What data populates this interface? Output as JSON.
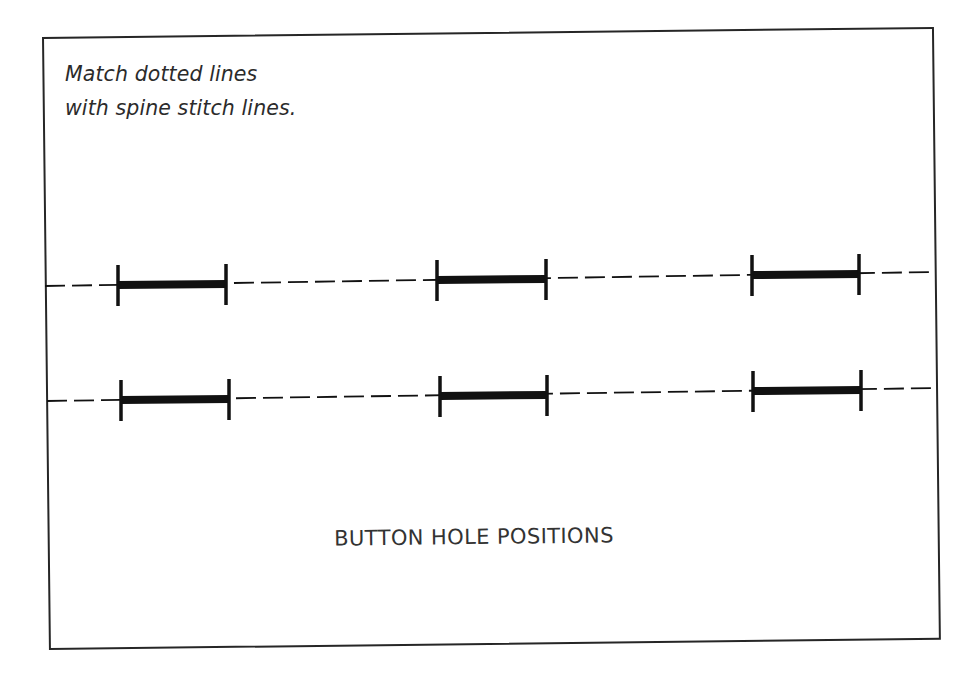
{
  "diagram": {
    "instruction_lines": [
      "Match dotted lines",
      "with spine stitch lines."
    ],
    "caption": "BUTTON HOLE POSITIONS",
    "colors": {
      "ink": "#111111",
      "border": "#262626",
      "text": "#2b2b2b",
      "background": "#ffffff"
    },
    "rows": [
      {
        "label": "row-1",
        "dashed_line": {
          "x1": 45,
          "y1": 286,
          "x2": 934,
          "y2": 272
        },
        "button_holes": [
          {
            "x1": 118,
            "x2": 226,
            "y1": 285,
            "y2": 284
          },
          {
            "x1": 437,
            "x2": 546,
            "y1": 280,
            "y2": 279
          },
          {
            "x1": 752,
            "x2": 859,
            "y1": 275,
            "y2": 274
          }
        ]
      },
      {
        "label": "row-2",
        "dashed_line": {
          "x1": 47,
          "y1": 401,
          "x2": 937,
          "y2": 388
        },
        "button_holes": [
          {
            "x1": 121,
            "x2": 229,
            "y1": 400,
            "y2": 399
          },
          {
            "x1": 440,
            "x2": 547,
            "y1": 396,
            "y2": 395
          },
          {
            "x1": 753,
            "x2": 861,
            "y1": 391,
            "y2": 390
          }
        ]
      }
    ]
  }
}
